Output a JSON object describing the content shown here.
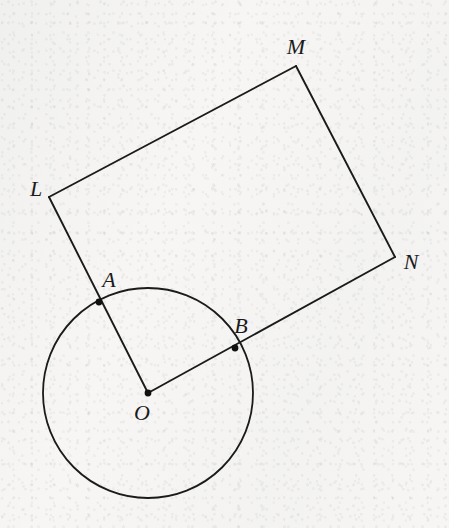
{
  "figure": {
    "canvas": {
      "width": 449,
      "height": 528
    },
    "background_color": "#f6f5f3",
    "stroke_color": "#1b1b1b",
    "stroke_width": 1.8,
    "label_color": "#1b1b1b",
    "label_font_size": 22
  },
  "points": [
    {
      "id": "L",
      "label": "L",
      "x": 49,
      "y": 197,
      "marker": false,
      "label_x": 36,
      "label_y": 189
    },
    {
      "id": "M",
      "label": "M",
      "x": 296,
      "y": 66,
      "marker": false,
      "label_x": 296,
      "label_y": 47
    },
    {
      "id": "N",
      "label": "N",
      "x": 395,
      "y": 257,
      "marker": false,
      "label_x": 411,
      "label_y": 262
    },
    {
      "id": "A",
      "label": "A",
      "x": 99,
      "y": 302,
      "marker": true,
      "label_x": 109,
      "label_y": 280
    },
    {
      "id": "B",
      "label": "B",
      "x": 235,
      "y": 348,
      "marker": true,
      "label_x": 241,
      "label_y": 326
    },
    {
      "id": "O",
      "label": "O",
      "x": 148,
      "y": 393,
      "marker": true,
      "label_x": 142,
      "label_y": 413
    }
  ],
  "circle": {
    "id": "circle-O",
    "center_x": 148,
    "center_y": 393,
    "radius": 105
  },
  "segments": [
    {
      "id": "segment-LM",
      "from": "L",
      "to": "M"
    },
    {
      "id": "segment-MN",
      "from": "M",
      "to": "N"
    },
    {
      "id": "segment-LO",
      "from": "L",
      "to": "O",
      "passes_through": "A"
    },
    {
      "id": "segment-NO",
      "from": "N",
      "to": "O",
      "passes_through": "B"
    }
  ],
  "marker_radius": 3.4
}
